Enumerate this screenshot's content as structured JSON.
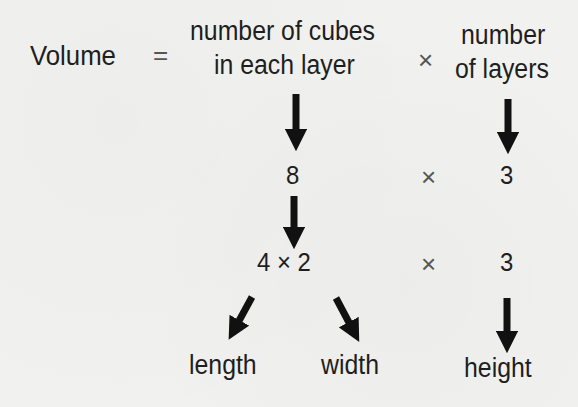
{
  "diagram": {
    "title_row": {
      "volume_label": "Volume",
      "equals": "=",
      "cubes_line1": "number of cubes",
      "cubes_line2": "in each layer",
      "times": "×",
      "layers_line1": "number",
      "layers_line2": "of layers"
    },
    "row2": {
      "cubes_value": "8",
      "times": "×",
      "layers_value": "3"
    },
    "row3": {
      "cubes_expr": "4 × 2",
      "times": "×",
      "layers_value": "3"
    },
    "labels": {
      "length": "length",
      "width": "width",
      "height": "height"
    },
    "icons": {
      "arrow_down": "arrow-down-icon",
      "arrow_down_left": "arrow-down-left-icon",
      "arrow_down_right": "arrow-down-right-icon"
    },
    "colors": {
      "background": "#f1f1ef",
      "text": "#1e1e1e",
      "arrow": "#111111",
      "operator": "#555555"
    }
  }
}
